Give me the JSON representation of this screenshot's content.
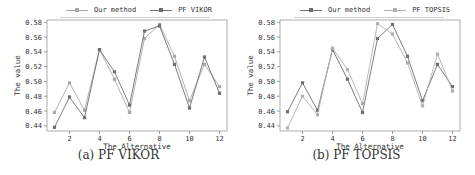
{
  "chart_data": [
    {
      "type": "line",
      "title": "",
      "caption": "(a) PF VIKOR",
      "xlabel": "The Alternative",
      "ylabel": "The value",
      "x": [
        1,
        2,
        3,
        4,
        5,
        6,
        7,
        8,
        9,
        10,
        11,
        12
      ],
      "xticks": [
        2,
        4,
        6,
        8,
        10,
        12
      ],
      "yticks": [
        0.44,
        0.46,
        0.48,
        0.5,
        0.52,
        0.54,
        0.56,
        0.58
      ],
      "ytick_labels": [
        "0.44",
        "0.46",
        "0.48",
        "0.50",
        "0.52",
        "0.54",
        "0.56",
        "0.58"
      ],
      "xlim": [
        0.5,
        12.5
      ],
      "ylim": [
        0.433,
        0.583
      ],
      "grid": false,
      "legend_position": "top",
      "series": [
        {
          "name": "Our method",
          "color": "#a8a8a8",
          "values": [
            0.458,
            0.498,
            0.461,
            0.543,
            0.503,
            0.458,
            0.558,
            0.577,
            0.534,
            0.474,
            0.523,
            0.493
          ]
        },
        {
          "name": "PF VIKOR",
          "color": "#6e6e6e",
          "values": [
            0.438,
            0.479,
            0.451,
            0.543,
            0.513,
            0.468,
            0.568,
            0.575,
            0.523,
            0.464,
            0.533,
            0.484
          ]
        }
      ]
    },
    {
      "type": "line",
      "title": "",
      "caption": "(b) PF TOPSIS",
      "xlabel": "The Alternative",
      "ylabel": "The value",
      "x": [
        1,
        2,
        3,
        4,
        5,
        6,
        7,
        8,
        9,
        10,
        11,
        12
      ],
      "xticks": [
        2,
        4,
        6,
        8,
        10,
        12
      ],
      "yticks": [
        0.44,
        0.46,
        0.48,
        0.5,
        0.52,
        0.54,
        0.56,
        0.58
      ],
      "ytick_labels": [
        "0.44",
        "0.46",
        "0.48",
        "0.50",
        "0.52",
        "0.54",
        "0.56",
        "0.58"
      ],
      "xlim": [
        0.5,
        12.5
      ],
      "ylim": [
        0.433,
        0.583
      ],
      "grid": false,
      "legend_position": "top",
      "series": [
        {
          "name": "Our method",
          "color": "#6e6e6e",
          "values": [
            0.459,
            0.498,
            0.461,
            0.543,
            0.503,
            0.458,
            0.558,
            0.577,
            0.534,
            0.474,
            0.523,
            0.493
          ]
        },
        {
          "name": "PF TOPSIS",
          "color": "#b0b0b0",
          "values": [
            0.437,
            0.48,
            0.455,
            0.545,
            0.516,
            0.47,
            0.578,
            0.564,
            0.525,
            0.467,
            0.537,
            0.487
          ]
        }
      ]
    }
  ]
}
